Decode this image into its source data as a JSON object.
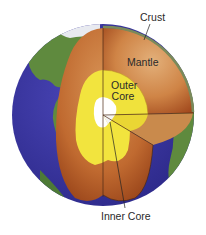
{
  "diagram": {
    "labels": {
      "crust": "Crust",
      "mantle": "Mantle",
      "outer_core_line1": "Outer",
      "outer_core_line2": "Core",
      "inner_core": "Inner Core"
    },
    "layers": [
      {
        "name": "Crust",
        "color": "#6b8a4a"
      },
      {
        "name": "Mantle",
        "color": "#c7763a"
      },
      {
        "name": "Outer Core",
        "color": "#f2e23a"
      },
      {
        "name": "Inner Core",
        "color": "#ffffff"
      }
    ],
    "colors": {
      "ocean": "#3a36a0",
      "land": "#5f8a3e",
      "ice": "#eef0f4",
      "mantle_light": "#dca46a",
      "mantle_dark": "#a0481c",
      "outer_core": "#f0e23c",
      "outer_core_edge": "#e6cf2a",
      "inner_core": "#ffffff",
      "cut_line": "#4a2a14",
      "leader_line": "#222222"
    }
  }
}
